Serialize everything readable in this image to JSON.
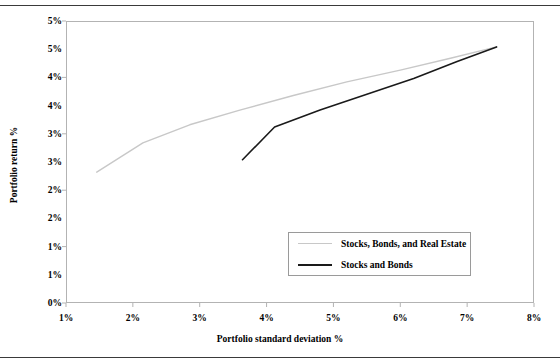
{
  "chart_data": {
    "type": "line",
    "title": "",
    "xlabel": "Portfolio standard deviation %",
    "ylabel": "Portfolio return %",
    "xlim": [
      1,
      8
    ],
    "ylim": [
      0,
      5
    ],
    "xticks": [
      1,
      2,
      3,
      4,
      5,
      6,
      7,
      8
    ],
    "xtick_labels": [
      "1%",
      "2%",
      "3%",
      "4%",
      "5%",
      "6%",
      "7%",
      "8%"
    ],
    "yticks": [
      0,
      0.5,
      1,
      1.5,
      2,
      2.5,
      3,
      3.5,
      4,
      4.5,
      5
    ],
    "ytick_labels": [
      "0%",
      "1%",
      "1%",
      "2%",
      "2%",
      "3%",
      "3%",
      "4%",
      "4%",
      "5%",
      "5%"
    ],
    "grid": false,
    "legend_position": "center-bottom-inside",
    "series": [
      {
        "name": "Stocks, Bonds, and Real Estate",
        "color": "#c8c8c8",
        "width": 1.4,
        "x": [
          1.46,
          2.15,
          2.85,
          3.6,
          4.4,
          5.2,
          6.0,
          6.75,
          7.44
        ],
        "y": [
          2.32,
          2.84,
          3.16,
          3.42,
          3.68,
          3.92,
          4.13,
          4.34,
          4.54
        ]
      },
      {
        "name": "Stocks and Bonds",
        "color": "#1a1a1a",
        "width": 1.6,
        "x": [
          3.64,
          4.12,
          4.8,
          5.5,
          6.2,
          6.85,
          7.44
        ],
        "y": [
          2.54,
          3.12,
          3.42,
          3.7,
          3.98,
          4.28,
          4.54
        ]
      }
    ]
  },
  "axes": {
    "x_title": "Portfolio standard deviation %",
    "y_title": "Portfolio return %",
    "x_tick_labels": [
      "1%",
      "2%",
      "3%",
      "4%",
      "5%",
      "6%",
      "7%",
      "8%"
    ],
    "y_tick_labels": [
      "5%",
      "5%",
      "4%",
      "4%",
      "3%",
      "3%",
      "2%",
      "2%",
      "1%",
      "1%",
      "0%"
    ]
  },
  "legend": {
    "entries": [
      {
        "label": "Stocks, Bonds, and Real Estate",
        "color": "#c8c8c8"
      },
      {
        "label": "Stocks and Bonds",
        "color": "#1a1a1a"
      }
    ]
  }
}
